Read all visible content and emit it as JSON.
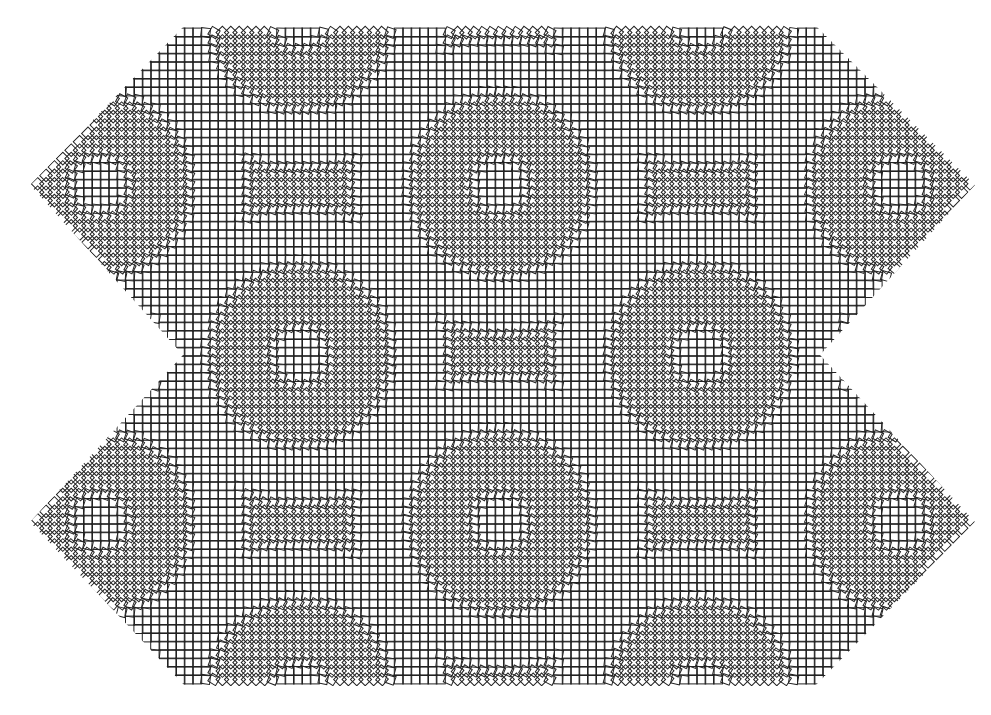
{
  "artwork": {
    "description": "Generative pattern of small outlined squares arranged in a grid, with bands where squares rotate toward 45 degrees, clipped to a double-chevron outline",
    "background": "#ffffff",
    "stroke_color": "#222222",
    "square_size": 9,
    "grid_pitch": 8.4,
    "outline": [
      [
        185,
        25
      ],
      [
        815,
        25
      ],
      [
        975,
        185
      ],
      [
        820,
        355
      ],
      [
        975,
        522
      ],
      [
        815,
        686
      ],
      [
        185,
        686
      ],
      [
        30,
        522
      ],
      [
        183,
        355
      ],
      [
        30,
        185
      ]
    ]
  }
}
